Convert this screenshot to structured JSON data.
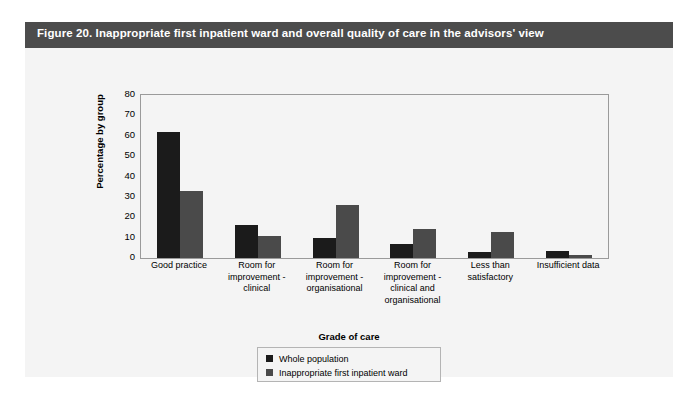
{
  "figure": {
    "title": "Figure 20. Inappropriate first inpatient ward and overall quality of care in the advisors' view",
    "header_color": "#4c4c4c",
    "panel_background": "#f4f4f4"
  },
  "chart_data": {
    "type": "bar",
    "title": "",
    "xlabel": "Grade of care",
    "ylabel": "Percentage by group",
    "ylim": [
      0,
      80
    ],
    "yticks": [
      80,
      70,
      60,
      50,
      40,
      30,
      20,
      10,
      0
    ],
    "grid": false,
    "legend_position": "bottom-center",
    "legend_title": "Grade of care",
    "categories": [
      "Good practice",
      "Room for improvement - clinical",
      "Room for improvement - organisational",
      "Room for improvement - clinical and organisational",
      "Less than satisfactory",
      "Insufficient data"
    ],
    "category_lines": [
      [
        "Good practice"
      ],
      [
        "Room for",
        "improvement -",
        "clinical"
      ],
      [
        "Room for",
        "improvement -",
        "organisational"
      ],
      [
        "Room for",
        "improvement -",
        "clinical and",
        "organisational"
      ],
      [
        "Less than",
        "satisfactory"
      ],
      [
        "Insufficient data"
      ]
    ],
    "series": [
      {
        "name": "Whole population",
        "color": "#1b1b1b",
        "values": [
          62,
          16,
          10,
          7,
          3,
          3.5
        ]
      },
      {
        "name": "Inappropriate first inpatient ward",
        "color": "#4a4a4a",
        "values": [
          33,
          11,
          26,
          14,
          13,
          1.5
        ]
      }
    ]
  }
}
